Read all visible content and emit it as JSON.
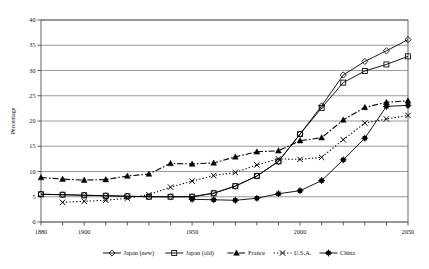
{
  "chart_data": {
    "type": "line",
    "title": "",
    "xlabel": "",
    "ylabel": "Percentage",
    "xlim": [
      1880,
      2050
    ],
    "ylim": [
      0,
      40
    ],
    "ytick_step": 5,
    "yticks": [
      0,
      5,
      10,
      15,
      20,
      25,
      30,
      35,
      40
    ],
    "xticks": [
      1880,
      1890,
      1900,
      1910,
      1920,
      1930,
      1940,
      1950,
      1960,
      1970,
      1980,
      1990,
      2000,
      2010,
      2020,
      2030,
      2040,
      2050
    ],
    "xtick_labels_shown": [
      "1880",
      "1900",
      "1950",
      "2000",
      "2050"
    ],
    "grid": "horizontal",
    "legend_position": "bottom",
    "series": [
      {
        "name": "Japan (new)",
        "marker": "diamond-open",
        "linestyle": "solid",
        "x": [
          1880,
          1890,
          1900,
          1910,
          1920,
          1930,
          1940,
          1950,
          1960,
          1970,
          1980,
          1990,
          2000,
          2010,
          2020,
          2030,
          2040,
          2050
        ],
        "y": [
          5.5,
          5.4,
          5.3,
          5.2,
          5.1,
          5.0,
          5.0,
          5.0,
          5.7,
          7.1,
          9.1,
          12.0,
          17.4,
          23.0,
          29.1,
          31.8,
          33.9,
          36.1
        ]
      },
      {
        "name": "Japan (old)",
        "marker": "square-open",
        "linestyle": "solid",
        "x": [
          1880,
          1890,
          1900,
          1910,
          1920,
          1930,
          1940,
          1950,
          1960,
          1970,
          1980,
          1990,
          2000,
          2010,
          2020,
          2030,
          2040,
          2050
        ],
        "y": [
          5.5,
          5.4,
          5.3,
          5.2,
          5.1,
          5.0,
          5.0,
          5.0,
          5.7,
          7.1,
          9.1,
          12.0,
          17.4,
          22.6,
          27.6,
          29.9,
          31.2,
          32.8
        ]
      },
      {
        "name": "France",
        "marker": "triangle-filled",
        "linestyle": "dash-dot",
        "x": [
          1880,
          1890,
          1900,
          1910,
          1920,
          1930,
          1940,
          1950,
          1960,
          1970,
          1980,
          1990,
          2000,
          2010,
          2020,
          2030,
          2040,
          2050
        ],
        "y": [
          8.8,
          8.5,
          8.3,
          8.4,
          9.1,
          9.5,
          11.6,
          11.5,
          11.7,
          12.9,
          13.9,
          14.1,
          16.1,
          16.7,
          20.2,
          22.7,
          23.7,
          24.0
        ]
      },
      {
        "name": "U.S.A.",
        "marker": "x-cross",
        "linestyle": "dotted",
        "x": [
          1890,
          1900,
          1910,
          1920,
          1930,
          1940,
          1950,
          1960,
          1970,
          1980,
          1990,
          2000,
          2010,
          2020,
          2030,
          2040,
          2050
        ],
        "y": [
          3.9,
          4.1,
          4.3,
          4.7,
          5.4,
          6.9,
          8.1,
          9.2,
          9.8,
          11.3,
          12.5,
          12.4,
          12.8,
          16.3,
          19.6,
          20.4,
          21.1
        ]
      },
      {
        "name": "China",
        "marker": "star-filled",
        "linestyle": "solid",
        "x": [
          1950,
          1960,
          1970,
          1980,
          1990,
          2000,
          2010,
          2020,
          2030,
          2040,
          2050
        ],
        "y": [
          4.5,
          4.4,
          4.3,
          4.7,
          5.6,
          6.2,
          8.2,
          12.3,
          16.6,
          22.9,
          23.1
        ]
      }
    ]
  },
  "axis": {
    "y_title": "Percentage"
  },
  "legend": {
    "items": [
      {
        "label": "Japan (new)"
      },
      {
        "label": "Japan (old)"
      },
      {
        "label": "France"
      },
      {
        "label": "U.S.A."
      },
      {
        "label": "China"
      }
    ]
  }
}
